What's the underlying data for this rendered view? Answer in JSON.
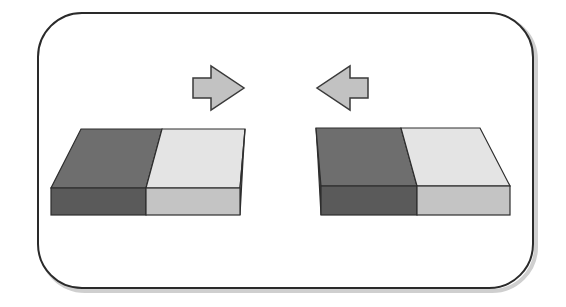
{
  "diagram": {
    "colors": {
      "background": "#ffffff",
      "frame_stroke": "#2a2a2a",
      "frame_shadow": "#c8c8c8",
      "arrow_fill": "#c2c2c2",
      "arrow_stroke": "#3a3a3a",
      "dark_top": "#6e6e6e",
      "dark_front": "#5a5a5a",
      "light_top": "#e4e4e4",
      "light_front": "#c4c4c4",
      "edge": "#2e2e2e"
    },
    "arrows": [
      {
        "name": "right-arrow",
        "direction": "right"
      },
      {
        "name": "left-arrow",
        "direction": "left"
      }
    ],
    "slabs": [
      {
        "name": "left-slab",
        "left_part": "dark",
        "right_part": "light"
      },
      {
        "name": "right-slab",
        "left_part": "dark",
        "right_part": "light"
      }
    ]
  }
}
